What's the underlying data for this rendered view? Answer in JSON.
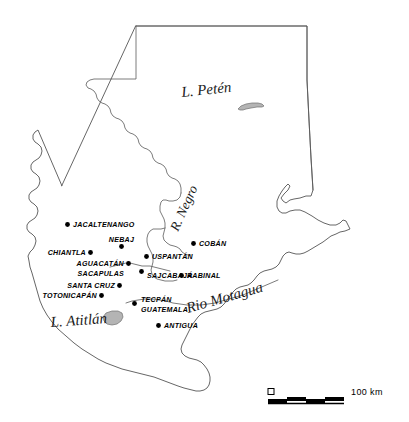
{
  "map": {
    "title": "Guatemala",
    "background_color": "#ffffff",
    "outline_color": "#555555",
    "lake_fill_color": "#b4b4b4",
    "dot_color": "#000000",
    "cities": [
      {
        "name": "JACALTENANGO",
        "dot": [
          67.5,
          224.5
        ],
        "label_x": 73,
        "label_y": 227,
        "anchor": "start"
      },
      {
        "name": "NEBAJ",
        "dot": [
          121.5,
          246.5
        ],
        "label_x": 121.5,
        "label_y": 241.5,
        "anchor": "middle"
      },
      {
        "name": "CHIANTLA",
        "dot": [
          90.5,
          252.5
        ],
        "label_x": 86,
        "label_y": 255,
        "anchor": "end"
      },
      {
        "name": "COBÁN",
        "dot": [
          193.5,
          243.5
        ],
        "label_x": 199,
        "label_y": 246,
        "anchor": "start"
      },
      {
        "name": "USPANTÁN",
        "dot": [
          146.5,
          256.5
        ],
        "label_x": 152,
        "label_y": 259,
        "anchor": "start"
      },
      {
        "name": "AGUACATÁN",
        "dot": [
          128.5,
          263.5
        ],
        "label_x": 124,
        "label_y": 266,
        "anchor": "end"
      },
      {
        "name": "SACAPULAS",
        "dot": null,
        "label_x": 124,
        "label_y": 276,
        "anchor": "end"
      },
      {
        "name": "SAJCABAJÁ",
        "dot": [
          141.5,
          271.5
        ],
        "label_x": 147,
        "label_y": 277.5,
        "anchor": "start"
      },
      {
        "name": "RABINAL",
        "dot": [
          181.5,
          275.5
        ],
        "label_x": 187,
        "label_y": 278,
        "anchor": "start"
      },
      {
        "name": "SANTA CRUZ",
        "dot": [
          119.5,
          285.5
        ],
        "label_x": 115,
        "label_y": 288,
        "anchor": "end"
      },
      {
        "name": "TOTONICAPÁN",
        "dot": [
          101.5,
          295.5
        ],
        "label_x": 97,
        "label_y": 298,
        "anchor": "end"
      },
      {
        "name": "TECPÁN",
        "dot": [
          134.5,
          303.5
        ],
        "label_x": 141,
        "label_y": 301.5,
        "anchor": "start"
      },
      {
        "name": "GUATEMALA",
        "dot": null,
        "label_x": 141,
        "label_y": 311.5,
        "anchor": "start"
      },
      {
        "name": "ANTIGUA",
        "dot": [
          158.5,
          325.5
        ],
        "label_x": 164,
        "label_y": 328,
        "anchor": "start"
      }
    ],
    "features": [
      {
        "name": "L. Petén",
        "x": 182,
        "y": 97,
        "rotation": -6,
        "size": "large"
      },
      {
        "name": "R. Negro",
        "x": 178,
        "y": 232,
        "rotation": -66,
        "size": "small"
      },
      {
        "name": "Rio Motagua",
        "x": 188,
        "y": 313,
        "rotation": -16,
        "size": "large"
      },
      {
        "name": "L. Atitlán",
        "x": 51,
        "y": 327,
        "rotation": -4,
        "size": "large"
      }
    ],
    "scale_bar": {
      "zero_label": "0",
      "max_label": "100 km",
      "segments": 4,
      "x": 268,
      "y": 400,
      "width": 76
    }
  }
}
